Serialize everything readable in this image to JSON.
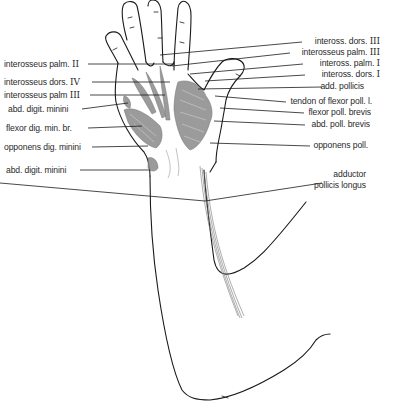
{
  "figure": {
    "line_color": "#1a1a1a",
    "muscle_color": "#7a7a7a"
  },
  "labels_left": [
    {
      "text": "interosseus palm.",
      "numeral": "II",
      "x": 4,
      "y": 59,
      "line_to": [
        175,
        64
      ]
    },
    {
      "text": "interosseus dors.",
      "numeral": "IV",
      "x": 4,
      "y": 78,
      "line_to": [
        170,
        82
      ]
    },
    {
      "text": "interosseus palm",
      "numeral": "III",
      "x": 4,
      "y": 91,
      "line_to": [
        165,
        95
      ]
    },
    {
      "text": "abd. digit. minini",
      "numeral": "",
      "x": 8,
      "y": 105,
      "line_to": [
        128,
        103
      ]
    },
    {
      "text": "flexor dig. min. br.",
      "numeral": "",
      "x": 6,
      "y": 124,
      "line_to": [
        142,
        126
      ]
    },
    {
      "text": "opponens dig. minini",
      "numeral": "",
      "x": 4,
      "y": 143,
      "line_to": [
        148,
        146
      ]
    },
    {
      "text": "abd. digit. minini",
      "numeral": "",
      "x": 6,
      "y": 165,
      "line_to": [
        150,
        170
      ]
    }
  ],
  "labels_right": [
    {
      "text": "inteross. dors.",
      "numeral": "III",
      "right": 14,
      "y": 37,
      "line_to": [
        160,
        55
      ]
    },
    {
      "text": "interosseus palm.",
      "numeral": "III",
      "right": 14,
      "y": 48,
      "line_to": [
        172,
        66
      ]
    },
    {
      "text": "inteross. palm.",
      "numeral": "I",
      "right": 14,
      "y": 59,
      "line_to": [
        190,
        74
      ]
    },
    {
      "text": "inteross. dors.",
      "numeral": "I",
      "right": 14,
      "y": 70,
      "line_to": [
        205,
        81
      ]
    },
    {
      "text": "add. pollicis",
      "numeral": "",
      "right": 30,
      "y": 82,
      "line_to": [
        198,
        89
      ]
    },
    {
      "text": "tendon of flexor poll. l.",
      "numeral": "",
      "right": 22,
      "y": 97,
      "line_to": [
        215,
        96
      ]
    },
    {
      "text": "flexor poll. brevis",
      "numeral": "",
      "right": 23,
      "y": 108,
      "line_to": [
        220,
        108
      ]
    },
    {
      "text": "abd. poll. brevis",
      "numeral": "",
      "right": 24,
      "y": 120,
      "line_to": [
        214,
        121
      ]
    },
    {
      "text": "opponens poll.",
      "numeral": "",
      "right": 26,
      "y": 141,
      "line_to": [
        210,
        143
      ]
    },
    {
      "text": "adductor",
      "numeral": "",
      "right": 28,
      "y": 170,
      "line_to": null
    },
    {
      "text": "pollicis longus",
      "numeral": "",
      "right": 28,
      "y": 181,
      "line_to": [
        205,
        201
      ]
    }
  ]
}
